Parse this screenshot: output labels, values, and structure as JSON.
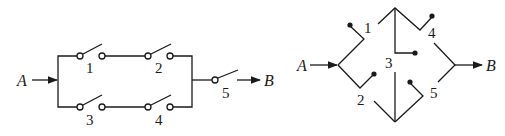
{
  "diagram_left": {
    "title": "Series-parallel switch network",
    "input_label": "A",
    "output_label": "B",
    "switches": [
      {
        "id": "1",
        "label": "1",
        "branch": "upper"
      },
      {
        "id": "2",
        "label": "2",
        "branch": "upper"
      },
      {
        "id": "3",
        "label": "3",
        "branch": "lower"
      },
      {
        "id": "4",
        "label": "4",
        "branch": "lower"
      },
      {
        "id": "5",
        "label": "5",
        "branch": "series"
      }
    ]
  },
  "diagram_right": {
    "title": "Bridge switch network",
    "input_label": "A",
    "output_label": "B",
    "switches": [
      {
        "id": "1",
        "label": "1"
      },
      {
        "id": "2",
        "label": "2"
      },
      {
        "id": "3",
        "label": "3"
      },
      {
        "id": "4",
        "label": "4"
      },
      {
        "id": "5",
        "label": "5"
      }
    ]
  },
  "colors": {
    "line": "#1a1a1a",
    "background": "#ffffff"
  }
}
